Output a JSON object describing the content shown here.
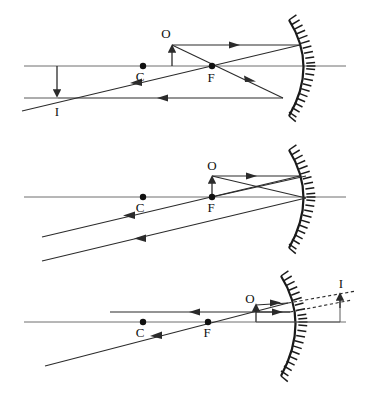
{
  "figure": {
    "background_color": "#ffffff",
    "ink_color": "#1a1a1a",
    "axis_color": "#6e6e6e"
  },
  "labels": {
    "object": "O",
    "center_of_curvature": "C",
    "focal_point": "F",
    "image": "I"
  },
  "panels": [
    {
      "name": "object-beyond-focus-real-image",
      "index": 1,
      "caption": "",
      "points": [
        {
          "id": "C",
          "label": "C",
          "x": 143,
          "y": 66
        },
        {
          "id": "F",
          "label": "F",
          "x": 212,
          "y": 66
        }
      ],
      "object": {
        "label": "O",
        "base_x": 172,
        "base_y": 66,
        "tip_x": 172,
        "tip_y": 45,
        "orientation": "upright"
      },
      "image": {
        "label": "I",
        "base_x": 57,
        "base_y": 98,
        "tip_x": 57,
        "tip_y": 66,
        "orientation": "inverted",
        "kind": "real"
      },
      "axis": {
        "x1": 24,
        "y1": 66,
        "x2": 346,
        "y2": 66
      },
      "mirror": {
        "vertex_x": 313,
        "vertex_y": 66,
        "top_y": 20,
        "bottom_y": 116,
        "sagitta": 28
      }
    },
    {
      "name": "object-at-focus-rays-parallel",
      "index": 2,
      "caption": "",
      "points": [
        {
          "id": "C",
          "label": "C",
          "x": 143,
          "y": 197
        },
        {
          "id": "F",
          "label": "F",
          "x": 212,
          "y": 197
        }
      ],
      "object": {
        "label": "O",
        "base_x": 212,
        "base_y": 197,
        "tip_x": 212,
        "tip_y": 175,
        "orientation": "upright"
      },
      "image": {
        "label": "",
        "kind": "none"
      },
      "axis": {
        "x1": 24,
        "y1": 197,
        "x2": 346,
        "y2": 197
      },
      "mirror": {
        "vertex_x": 313,
        "vertex_y": 197,
        "top_y": 150,
        "bottom_y": 248,
        "sagitta": 28
      }
    },
    {
      "name": "object-inside-focus-virtual-image",
      "index": 3,
      "caption": "",
      "points": [
        {
          "id": "C",
          "label": "C",
          "x": 143,
          "y": 322
        },
        {
          "id": "F",
          "label": "F",
          "x": 208,
          "y": 322
        }
      ],
      "object": {
        "label": "O",
        "base_x": 256,
        "base_y": 322,
        "tip_x": 256,
        "tip_y": 304,
        "orientation": "upright"
      },
      "image": {
        "label": "I",
        "base_x": 340,
        "base_y": 322,
        "tip_x": 340,
        "tip_y": 293,
        "orientation": "upright",
        "kind": "virtual"
      },
      "axis": {
        "x1": 24,
        "y1": 322,
        "x2": 346,
        "y2": 322
      },
      "mirror": {
        "vertex_x": 305,
        "vertex_y": 322,
        "top_y": 276,
        "bottom_y": 376,
        "sagitta": 26
      }
    }
  ],
  "legend": {
    "solid_ray": "real light ray",
    "dashed_ray": "virtual ray extension",
    "hatching": "back of mirror"
  }
}
